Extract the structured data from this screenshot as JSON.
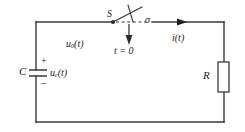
{
  "diagram": {
    "type": "electrical-schematic",
    "stroke_color": "#3a3a3a",
    "text_color": "#1a1a1a",
    "background_color": "#ffffff",
    "labels": {
      "capacitor": "C",
      "capacitor_voltage": "u",
      "capacitor_voltage_sub": "c",
      "capacitor_voltage_tail": "(t)",
      "polarity_plus": "+",
      "polarity_minus": "–",
      "source_voltage": "u",
      "source_voltage_sub": "0",
      "source_voltage_tail": "(t)",
      "switch": "S",
      "switch_terminal": "σ",
      "switch_time": "t = 0",
      "current": "i(t)",
      "resistor": "R"
    },
    "components": [
      {
        "name": "capacitor",
        "label": "C",
        "position": "left-branch"
      },
      {
        "name": "switch",
        "label": "S",
        "position": "top-center",
        "state": "open",
        "closes_at": "t = 0"
      },
      {
        "name": "resistor",
        "label": "R",
        "position": "right-branch"
      }
    ],
    "annotations": [
      {
        "name": "current-arrow",
        "label": "i(t)",
        "direction": "right"
      },
      {
        "name": "switch-action-arrow",
        "label": "t = 0",
        "direction": "down"
      }
    ]
  }
}
